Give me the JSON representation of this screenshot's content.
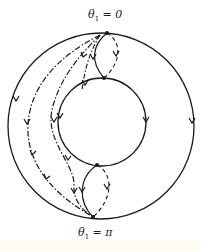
{
  "diagram": {
    "labels": {
      "top": {
        "symbol": "θ",
        "subscript": "1",
        "text": "= 0"
      },
      "bottom": {
        "symbol": "θ",
        "subscript": "1",
        "text": "= π"
      }
    },
    "elements": {
      "outer_circle": "Outer circle with clockwise flow arrows",
      "inner_circle": "Inner circle with flow arrows",
      "solid_connectors": "Solid curves joining outer and inner circles at top and bottom",
      "dashed_connectors": "Dashed curves joining outer and inner circles",
      "dash_dot_paths": "Two dash-dot trajectories from θ1=0 to θ1=π on the left side"
    },
    "colors": {
      "stroke": "#1a1a1a",
      "background": "#ffffff"
    }
  }
}
